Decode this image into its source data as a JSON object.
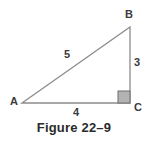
{
  "figure": {
    "caption": "Figure 22–9",
    "background_color": "#ffffff",
    "line_color": "#8c8c8c",
    "text_color": "#3b3b3b",
    "caption_color": "#2b2b2b",
    "right_angle_fill": "#b3b3b3",
    "right_angle_stroke": "#6e6e6e"
  },
  "diagram": {
    "type": "right-triangle",
    "vertices": [
      {
        "name": "A",
        "label": "A",
        "x": 22,
        "y": 103,
        "angle_type": "acute"
      },
      {
        "name": "B",
        "label": "B",
        "x": 130,
        "y": 27,
        "angle_type": "acute"
      },
      {
        "name": "C",
        "label": "C",
        "x": 130,
        "y": 103,
        "angle_type": "right"
      }
    ],
    "sides": [
      {
        "name": "hypotenuse",
        "from": "A",
        "to": "B",
        "label": "5"
      },
      {
        "name": "vertical-leg",
        "from": "B",
        "to": "C",
        "label": "3"
      },
      {
        "name": "base-leg",
        "from": "A",
        "to": "C",
        "label": "4"
      }
    ],
    "right_angle_marker": {
      "at_vertex": "C",
      "x": 118,
      "y": 91,
      "size": 12
    }
  }
}
